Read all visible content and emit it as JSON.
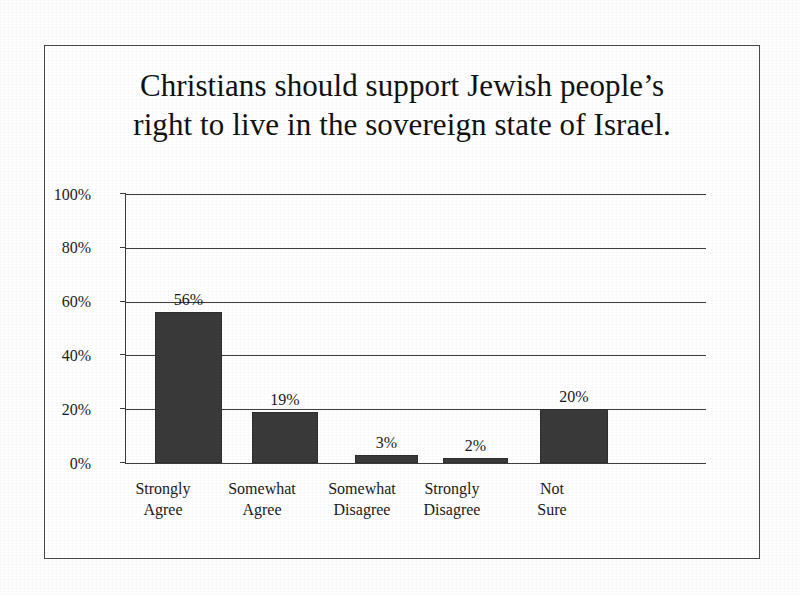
{
  "chart_data": {
    "type": "bar",
    "title": "Christians should support Jewish people’s\nright to live in the sovereign state of Israel.",
    "title_line1": "Christians should support Jewish people’s",
    "title_line2": "right to live in the sovereign state of Israel.",
    "categories": [
      "Strongly\nAgree",
      "Somewhat\nAgree",
      "Somewhat\nDisagree",
      "Strongly\nDisagree",
      "Not\nSure"
    ],
    "values": [
      56,
      19,
      3,
      2,
      20
    ],
    "value_labels": [
      "56%",
      "19%",
      "3%",
      "2%",
      "20%"
    ],
    "xlabel": "",
    "ylabel": "",
    "ylim": [
      0,
      100
    ],
    "ytick_values": [
      0,
      20,
      40,
      60,
      80,
      100
    ],
    "ytick_labels": [
      "0%",
      "20%",
      "40%",
      "60%",
      "80%",
      "100%"
    ],
    "grid": true,
    "legend": "none",
    "bar_color": "#3a3a3a",
    "axis_color": "#3d3d3d",
    "background_color": "#ffffff"
  }
}
